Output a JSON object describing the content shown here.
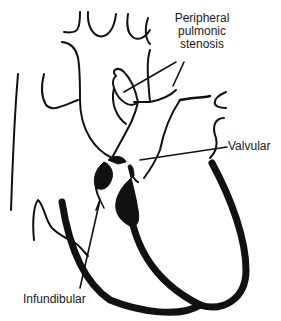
{
  "diagram": {
    "labels": {
      "peripheral": [
        "Peripheral",
        "pulmonic",
        "stenosis"
      ],
      "valvular": "Valvular",
      "infundibular": "Infundibular"
    },
    "colors": {
      "line": "#111111",
      "background": "#ffffff",
      "text": "#1a1a1a"
    }
  }
}
